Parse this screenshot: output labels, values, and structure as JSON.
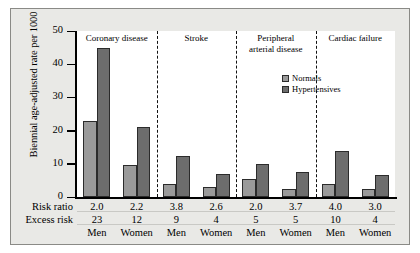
{
  "chart_data": {
    "type": "bar",
    "title": "",
    "xlabel": "",
    "ylabel": "Biennial age-adjusted rate per 1000",
    "ylim": [
      0,
      50
    ],
    "yticks": [
      0,
      10,
      20,
      30,
      40,
      50
    ],
    "grid": false,
    "legend_position": "inside-top-center",
    "legend": [
      "Normals",
      "Hypertensives"
    ],
    "panels": [
      "Coronary disease",
      "Stroke",
      "Peripheral arterial disease",
      "Cardiac failure"
    ],
    "categories": [
      "Coronary disease Men",
      "Coronary disease Women",
      "Stroke Men",
      "Stroke Women",
      "Peripheral arterial disease Men",
      "Peripheral arterial disease Women",
      "Cardiac failure Men",
      "Cardiac failure Women"
    ],
    "series": [
      {
        "name": "Normals",
        "values": [
          23,
          9.5,
          4,
          3,
          5.5,
          2.5,
          4,
          2.5
        ]
      },
      {
        "name": "Hypertensives",
        "values": [
          45,
          21,
          12.5,
          7,
          10,
          7.5,
          14,
          6.5
        ]
      }
    ],
    "annotations": {
      "risk_ratio_label": "Risk ratio",
      "excess_risk_label": "Excess risk",
      "risk_ratio": [
        "2.0",
        "2.2",
        "3.8",
        "2.6",
        "2.0",
        "3.7",
        "4.0",
        "3.0"
      ],
      "excess_risk": [
        "23",
        "12",
        "9",
        "4",
        "5",
        "5",
        "10",
        "4"
      ],
      "sex": [
        "Men",
        "Women",
        "Men",
        "Women",
        "Men",
        "Women",
        "Men",
        "Women"
      ]
    },
    "colors": {
      "normals": "#9a9a9a",
      "hypertensives": "#6d6d6d",
      "axis": "#000000",
      "panel_background": "#e9e9e6",
      "plot_background": "#ffffff"
    }
  },
  "axis": {
    "y_title": "Biennial age-adjusted rate per 1000",
    "tick_50": "50",
    "tick_40": "40",
    "tick_30": "30",
    "tick_20": "20",
    "tick_10": "10",
    "tick_0": "0"
  },
  "panels": {
    "p0": "Coronary disease",
    "p1": "Stroke",
    "p2_line1": "Peripheral",
    "p2_line2": "arterial disease",
    "p3": "Cardiac failure"
  },
  "legend": {
    "normals": "Normals",
    "hypertensives": "Hypertensives"
  },
  "table": {
    "risk_ratio_label": "Risk ratio",
    "excess_risk_label": "Excess risk",
    "rr": [
      "2.0",
      "2.2",
      "3.8",
      "2.6",
      "2.0",
      "3.7",
      "4.0",
      "3.0"
    ],
    "er": [
      "23",
      "12",
      "9",
      "4",
      "5",
      "5",
      "10",
      "4"
    ],
    "sex": [
      "Men",
      "Women",
      "Men",
      "Women",
      "Men",
      "Women",
      "Men",
      "Women"
    ]
  }
}
